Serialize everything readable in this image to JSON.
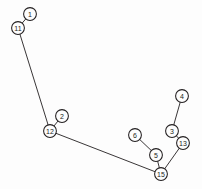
{
  "canvas": {
    "width": 202,
    "height": 189,
    "background": "#fdfdfd",
    "stroke_color": "#231f20",
    "node_fill": "#fdfdfd",
    "node_radius": 6.4,
    "label_font_size": 7
  },
  "chart_data": {
    "type": "scatter",
    "title": "",
    "subtitle": "",
    "xlabel": "",
    "ylabel": "",
    "grid": false,
    "legend": "none",
    "xlim": [
      0,
      202
    ],
    "ylim": [
      0,
      189
    ],
    "nodes": [
      {
        "id": "1",
        "label": "1",
        "x": 30,
        "y": 14
      },
      {
        "id": "11",
        "label": "11",
        "x": 18,
        "y": 28
      },
      {
        "id": "2",
        "label": "2",
        "x": 62,
        "y": 116
      },
      {
        "id": "12",
        "label": "12",
        "x": 50,
        "y": 131
      },
      {
        "id": "6",
        "label": "6",
        "x": 135,
        "y": 135
      },
      {
        "id": "5",
        "label": "5",
        "x": 156,
        "y": 155
      },
      {
        "id": "15",
        "label": "15",
        "x": 161,
        "y": 174
      },
      {
        "id": "13",
        "label": "13",
        "x": 183,
        "y": 143
      },
      {
        "id": "3",
        "label": "3",
        "x": 172,
        "y": 131
      },
      {
        "id": "4",
        "label": "4",
        "x": 182,
        "y": 96
      }
    ],
    "edges": [
      {
        "source": "1",
        "target": "11"
      },
      {
        "source": "11",
        "target": "12"
      },
      {
        "source": "2",
        "target": "12"
      },
      {
        "source": "12",
        "target": "15"
      },
      {
        "source": "6",
        "target": "5"
      },
      {
        "source": "5",
        "target": "15"
      },
      {
        "source": "15",
        "target": "13"
      },
      {
        "source": "13",
        "target": "3"
      },
      {
        "source": "3",
        "target": "4"
      }
    ]
  }
}
